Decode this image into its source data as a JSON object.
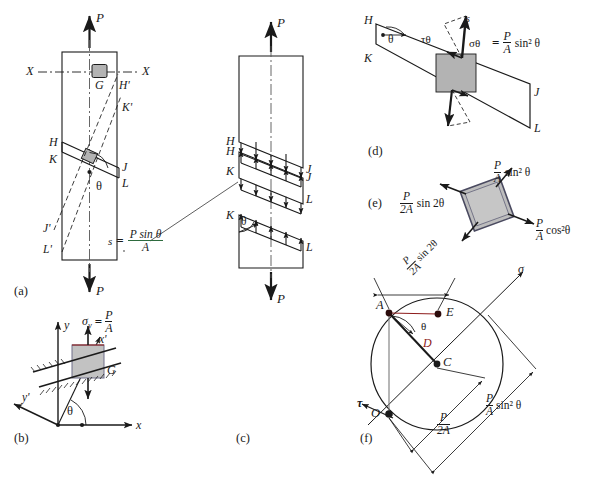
{
  "figure": {
    "background_color": "#ffffff",
    "line_color": "#1a1a1a",
    "element_fill": "#b3b3b3",
    "accent_red": "#8d1b1b",
    "panel_labels": [
      {
        "id": "a",
        "text": "(a)"
      },
      {
        "id": "b",
        "text": "(b)"
      },
      {
        "id": "c",
        "text": "(c)"
      },
      {
        "id": "d",
        "text": "(d)"
      },
      {
        "id": "e",
        "text": "(e)"
      },
      {
        "id": "f",
        "text": "(f)"
      }
    ]
  },
  "panel_a": {
    "label": "(a)",
    "load_top": "P",
    "load_bottom": "P",
    "axis_left": "X",
    "axis_right": "X",
    "element": "G",
    "plane_points": [
      "H",
      "K",
      "J",
      "L"
    ],
    "rotated_points": [
      "H'",
      "K'",
      "J'",
      "L'"
    ],
    "angle": "θ"
  },
  "panel_b": {
    "label": "(b)",
    "axis_y": "y",
    "axis_x": "x",
    "axis_x_prime": "x'",
    "axis_y_prime": "y'",
    "element": "G",
    "angle": "θ",
    "stress_symbol": "σ",
    "stress_subscript": "y",
    "stress_equals": "=",
    "stress_num": "P",
    "stress_den": "A"
  },
  "panel_c": {
    "label": "(c)",
    "load_top": "P",
    "load_bottom": "P",
    "segment_labels": [
      "H",
      "J",
      "H",
      "K",
      "J",
      "L",
      "K",
      "L"
    ],
    "angle": "θ",
    "shear_formula": {
      "lhs": "s",
      "equals": "=",
      "numerator": "P sin θ",
      "denominator": "A"
    }
  },
  "panel_d": {
    "label": "(d)",
    "points": [
      "H",
      "K",
      "J",
      "L"
    ],
    "angle": "θ",
    "resultant": "s",
    "shear_stress": "τθ",
    "normal_stress": "σθ",
    "equation": {
      "lhs": "σθ",
      "equals": "=",
      "numerator": "P",
      "denominator": "A",
      "factor": "sin² θ"
    }
  },
  "panel_e": {
    "label": "(e)",
    "normal_stress_top": {
      "numerator": "P",
      "denominator": "A",
      "factor": "sin² θ"
    },
    "shear_stress_left": {
      "numerator": "P",
      "denominator": "2A",
      "factor": "sin 2θ"
    },
    "normal_stress_right": {
      "numerator": "P",
      "denominator": "A",
      "factor": "cos²θ"
    }
  },
  "panel_f": {
    "label": "(f)",
    "axis_sigma": "σ",
    "axis_tau": "τ",
    "points": [
      "A",
      "E",
      "D",
      "C",
      "O"
    ],
    "angle": "θ",
    "dim_top": {
      "numerator": "P",
      "denominator": "2A",
      "factor": "sin 2θ"
    },
    "dim_mid": {
      "numerator": "P",
      "denominator": "2A"
    },
    "dim_right": {
      "numerator": "P",
      "denominator": "A",
      "factor": "sin² θ"
    }
  }
}
